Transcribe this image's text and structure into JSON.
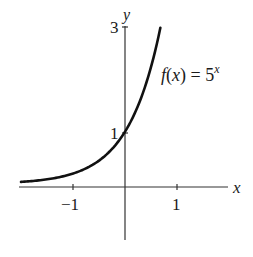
{
  "chart_data": {
    "type": "line",
    "title": "",
    "function_label": "f(x) = 5^x",
    "function_label_parts": {
      "f": "f",
      "open": "(",
      "x": "x",
      "close": ") = 5",
      "exp": "x"
    },
    "xlabel": "x",
    "ylabel": "y",
    "x_ticks": [
      -1,
      1
    ],
    "x_tick_labels": [
      "−1",
      "1"
    ],
    "y_ticks": [
      1,
      3
    ],
    "y_tick_labels": [
      "1",
      "3"
    ],
    "xlim": [
      -2.0,
      2.1
    ],
    "ylim": [
      -1.0,
      3.0
    ],
    "grid": false,
    "series": [
      {
        "name": "f(x) = 5^x",
        "x": [
          -2.0,
          -1.5,
          -1.0,
          -0.75,
          -0.5,
          -0.25,
          0.0,
          0.25,
          0.5,
          0.68
        ],
        "y": [
          0.04,
          0.089,
          0.2,
          0.299,
          0.447,
          0.669,
          1.0,
          1.495,
          2.236,
          2.99
        ]
      }
    ],
    "annotations": [
      {
        "text": "1",
        "at": [
          0,
          1
        ]
      },
      {
        "text": "3",
        "at": [
          0,
          3
        ]
      }
    ]
  }
}
